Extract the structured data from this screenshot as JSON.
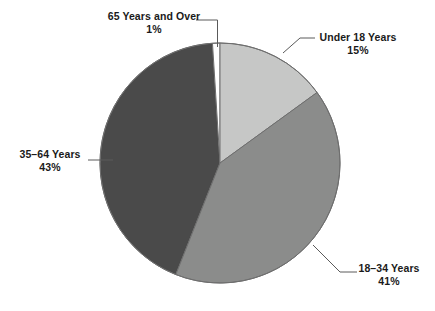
{
  "chart_data": {
    "type": "pie",
    "title": "",
    "subtitle": "",
    "xlabel": "",
    "ylabel": "",
    "legend_position": "none",
    "grid": false,
    "categories": [
      "65 Years and Over",
      "Under 18 Years",
      "18–34 Years",
      "35–64 Years"
    ],
    "values": [
      1,
      15,
      41,
      43
    ],
    "value_labels": [
      "1%",
      "15%",
      "41%",
      "43%"
    ],
    "unit": "%",
    "start_angle_deg": 0,
    "direction": "clockwise",
    "slices": [
      {
        "label": "65 Years and Over",
        "value": 1,
        "value_label": "1%",
        "color": "#ffffff",
        "stroke": "#6e6e6e"
      },
      {
        "label": "Under 18 Years",
        "value": 15,
        "value_label": "15%",
        "color": "#c6c7c6",
        "stroke": "#6e6e6e"
      },
      {
        "label": "18–34 Years",
        "value": 41,
        "value_label": "41%",
        "color": "#8b8c8b",
        "stroke": "#6e6e6e"
      },
      {
        "label": "35–64 Years",
        "value": 43,
        "value_label": "43%",
        "color": "#4a4a4a",
        "stroke": "#6e6e6e"
      }
    ]
  },
  "labels": {
    "over65": {
      "name": "65 Years and Over",
      "percent": "1%"
    },
    "under18": {
      "name": "Under 18 Years",
      "percent": "15%"
    },
    "age18_34": {
      "name": "18–34 Years",
      "percent": "41%"
    },
    "age35_64": {
      "name": "35–64 Years",
      "percent": "43%"
    }
  },
  "colors": {
    "background": "#ffffff",
    "text": "#1a1a1a",
    "leader_line": "#5a5a5a",
    "slice_over65": "#ffffff",
    "slice_under18": "#c6c7c6",
    "slice_18_34": "#8b8c8b",
    "slice_35_64": "#4a4a4a"
  }
}
